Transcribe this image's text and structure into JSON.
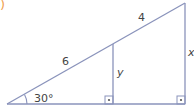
{
  "part_marker": {
    "text": ")",
    "color": "#f0a050"
  },
  "figure": {
    "stroke_color": "#8a93bb",
    "label_color": "#444444",
    "segments": {
      "hypotenuse_lower": "6",
      "hypotenuse_upper": "4",
      "inner_leg": "y",
      "outer_leg": "x"
    },
    "angle": "30°",
    "right_angles": [
      "inner",
      "outer"
    ]
  }
}
